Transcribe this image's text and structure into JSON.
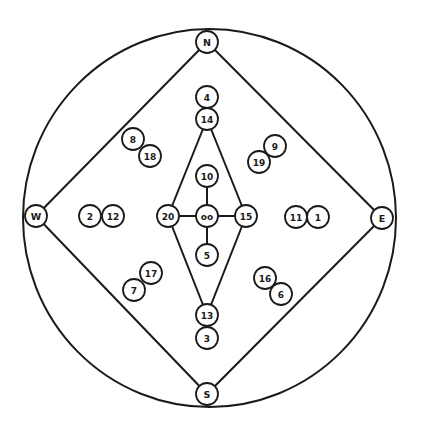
{
  "diagram": {
    "type": "circular-node-diagram",
    "outer_circle": {
      "cx": 209.5,
      "cy": 218,
      "rx": 186.5,
      "ry": 189
    },
    "node_radius": 11,
    "directions": [
      {
        "id": "N",
        "label": "N",
        "x": 207,
        "y": 42
      },
      {
        "id": "E",
        "label": "E",
        "x": 382,
        "y": 218
      },
      {
        "id": "S",
        "label": "S",
        "x": 207,
        "y": 394
      },
      {
        "id": "W",
        "label": "W",
        "x": 36,
        "y": 216
      }
    ],
    "center": {
      "id": "center",
      "label": "oo",
      "x": 207,
      "y": 216
    },
    "nodes": [
      {
        "id": "n1",
        "label": "1",
        "x": 318,
        "y": 217
      },
      {
        "id": "n2",
        "label": "2",
        "x": 90,
        "y": 216
      },
      {
        "id": "n3",
        "label": "3",
        "x": 207,
        "y": 338
      },
      {
        "id": "n4",
        "label": "4",
        "x": 207,
        "y": 97
      },
      {
        "id": "n5",
        "label": "5",
        "x": 207,
        "y": 255
      },
      {
        "id": "n6",
        "label": "6",
        "x": 281,
        "y": 294
      },
      {
        "id": "n7",
        "label": "7",
        "x": 134,
        "y": 290
      },
      {
        "id": "n8",
        "label": "8",
        "x": 133,
        "y": 139
      },
      {
        "id": "n9",
        "label": "9",
        "x": 275,
        "y": 146
      },
      {
        "id": "n10",
        "label": "10",
        "x": 207,
        "y": 176
      },
      {
        "id": "n11",
        "label": "11",
        "x": 296,
        "y": 217
      },
      {
        "id": "n12",
        "label": "12",
        "x": 113,
        "y": 216
      },
      {
        "id": "n13",
        "label": "13",
        "x": 207,
        "y": 315
      },
      {
        "id": "n14",
        "label": "14",
        "x": 207,
        "y": 119
      },
      {
        "id": "n15",
        "label": "15",
        "x": 246,
        "y": 216
      },
      {
        "id": "n16",
        "label": "16",
        "x": 265,
        "y": 278
      },
      {
        "id": "n17",
        "label": "17",
        "x": 151,
        "y": 273
      },
      {
        "id": "n18",
        "label": "18",
        "x": 150,
        "y": 156
      },
      {
        "id": "n19",
        "label": "19",
        "x": 259,
        "y": 162
      },
      {
        "id": "n20",
        "label": "20",
        "x": 168,
        "y": 216
      }
    ],
    "edges": [
      [
        "N",
        "E"
      ],
      [
        "E",
        "S"
      ],
      [
        "S",
        "W"
      ],
      [
        "W",
        "N"
      ],
      [
        "n14",
        "n20"
      ],
      [
        "n14",
        "n15"
      ],
      [
        "n13",
        "n20"
      ],
      [
        "n13",
        "n15"
      ],
      [
        "n20",
        "center"
      ],
      [
        "center",
        "n15"
      ],
      [
        "n10",
        "center"
      ],
      [
        "center",
        "n5"
      ]
    ]
  }
}
